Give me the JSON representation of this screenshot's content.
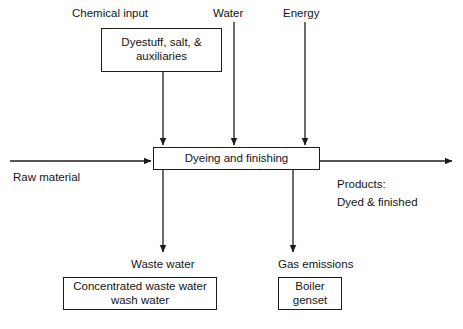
{
  "diagram": {
    "type": "process-flow",
    "orientation": "horizontal",
    "colors": {
      "stroke": "#1c1c1c",
      "text": "#141414",
      "background": "#ffffff"
    },
    "process": {
      "label": "Dyeing and finishing"
    },
    "inputs_top": [
      {
        "name": "chemical-input",
        "label": "Chemical input",
        "detail_box": "Dyestuff, salt, &\nauxiliaries"
      },
      {
        "name": "water",
        "label": "Water",
        "detail_box": null
      },
      {
        "name": "energy",
        "label": "Energy",
        "detail_box": null
      }
    ],
    "input_left": {
      "label": "Raw material"
    },
    "output_right": {
      "label": "Products:",
      "detail": "Dyed & finished"
    },
    "outputs_bottom": [
      {
        "name": "waste-water",
        "label": "Waste water",
        "detail_box": "Concentrated waste water\nwash water"
      },
      {
        "name": "gas-emissions",
        "label": "Gas emissions",
        "detail_box": "Boiler\ngenset"
      }
    ],
    "boxes": {
      "chemicals": "Dyestuff, salt, &\nauxiliaries",
      "process": "Dyeing and finishing",
      "wastewater": "Concentrated waste water\nwash water",
      "boiler": "Boiler\ngenset"
    },
    "caption_partial": ""
  }
}
